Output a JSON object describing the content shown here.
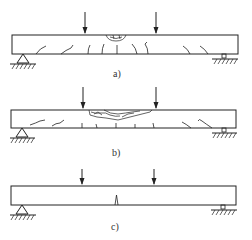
{
  "figure": {
    "panels": [
      {
        "id": "a",
        "label": "a)",
        "description": "Beam under two-point loading with flexural cracks and crushing zone at top midspan"
      },
      {
        "id": "b",
        "label": "b)",
        "description": "Beam under two-point loading with extensive compression-zone crushing between load points and flexural cracks"
      },
      {
        "id": "c",
        "label": "c)",
        "description": "Beam under two-point loading with a single flexural crack at midspan"
      }
    ],
    "elements": {
      "load_arrows_per_panel": 2,
      "supports": [
        "pin-support-left",
        "roller-support-right"
      ]
    },
    "colors": {
      "line": "#222222",
      "background": "#ffffff"
    }
  }
}
